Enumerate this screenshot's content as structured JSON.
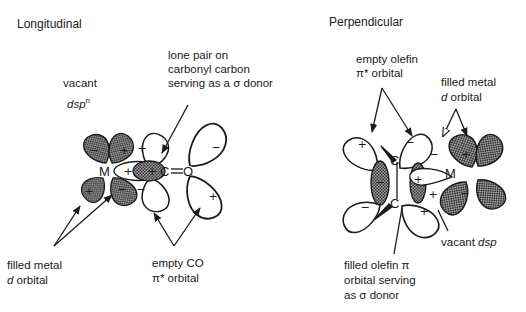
{
  "longitudinal": {
    "title": "Longitudinal",
    "labels": {
      "lone_pair_1": "lone pair on",
      "lone_pair_2": "carbonyl carbon",
      "lone_pair_3": "serving as a σ donor",
      "vacant_1": "vacant",
      "vacant_2_main": "dsp",
      "vacant_2_sup": "n",
      "filled_1": "filled metal",
      "filled_2_italic": "d",
      "filled_2_rest": " orbital",
      "empty_co_1": "empty CO",
      "empty_co_2": "π* orbital"
    },
    "atoms": {
      "metal": "M",
      "carbon": "C",
      "oxygen": "O"
    },
    "signs": {
      "plus": "+",
      "minus": "−"
    }
  },
  "perpendicular": {
    "title": "Perpendicular",
    "labels": {
      "empty_olefin_1": "empty olefin",
      "empty_olefin_2": "π* orbital",
      "filled_metal_1": "filled metal",
      "filled_metal_2_italic": "d",
      "filled_metal_2_rest": " orbital",
      "vacant_main": "vacant ",
      "vacant_italic": "dsp",
      "filled_olefin_1": "filled olefin π",
      "filled_olefin_2": "orbital serving",
      "filled_olefin_3": "as σ donor"
    },
    "atoms": {
      "metal": "M",
      "carbon_top": "C",
      "carbon_bottom": "C"
    },
    "signs": {
      "plus": "+",
      "minus": "−"
    }
  },
  "colors": {
    "ink": "#1a1a1a",
    "filled_lobe": "#6e6e6e",
    "empty_lobe": "#ffffff",
    "background": "#ffffff"
  }
}
